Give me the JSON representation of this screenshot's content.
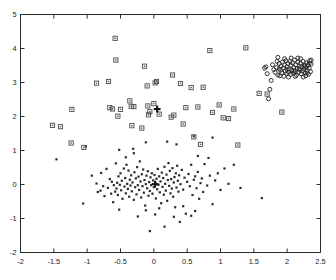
{
  "figure": {
    "title": "",
    "background": "#ffffff",
    "axis_color": "#2b2b2b"
  },
  "axes": {
    "x_ticks": [
      "-2",
      "-1.5",
      "-1",
      "-0.5",
      "0",
      "0.5",
      "1",
      "1.5",
      "2",
      "2.5"
    ],
    "x_tick_values": [
      -2,
      -1.5,
      -1,
      -0.5,
      0,
      0.5,
      1,
      1.5,
      2,
      2.5
    ],
    "y_ticks": [
      "-2",
      "-1",
      "0",
      "1",
      "2",
      "3",
      "4",
      "5"
    ],
    "y_tick_values": [
      -2,
      -1,
      0,
      1,
      2,
      3,
      4,
      5
    ]
  },
  "chart_data": {
    "type": "scatter",
    "title": "",
    "xlabel": "",
    "ylabel": "",
    "xlim": [
      -2,
      2.5
    ],
    "ylim": [
      -2,
      5
    ],
    "grid": false,
    "legend": "none",
    "series": [
      {
        "name": "cluster-1-dots",
        "marker": "filled-dot",
        "color": "#2a2a2a",
        "points": [
          [
            -1.46,
            0.74
          ],
          [
            -1.06,
            -0.56
          ],
          [
            -1.02,
            1.12
          ],
          [
            -0.93,
            0.26
          ],
          [
            -0.86,
            0.03
          ],
          [
            -0.84,
            -0.22
          ],
          [
            -0.8,
            -0.18
          ],
          [
            -0.79,
            0.34
          ],
          [
            -0.76,
            -0.05
          ],
          [
            -0.74,
            -0.34
          ],
          [
            -0.71,
            0.46
          ],
          [
            -0.69,
            -0.1
          ],
          [
            -0.66,
            0.16
          ],
          [
            -0.64,
            -0.27
          ],
          [
            -0.63,
            0.08
          ],
          [
            -0.61,
            -0.52
          ],
          [
            -0.6,
            -0.02
          ],
          [
            -0.58,
            -0.21
          ],
          [
            -0.57,
            0.62
          ],
          [
            -0.56,
            -0.12
          ],
          [
            -0.55,
            0.05
          ],
          [
            -0.54,
            -0.31
          ],
          [
            -0.53,
            0.24
          ],
          [
            -0.52,
            -0.74
          ],
          [
            -0.51,
            -0.01
          ],
          [
            -0.5,
            0.33
          ],
          [
            -0.49,
            -0.17
          ],
          [
            -0.48,
            0.11
          ],
          [
            -0.47,
            -0.42
          ],
          [
            -0.45,
            0.47
          ],
          [
            -0.44,
            -0.06
          ],
          [
            -0.43,
            0.19
          ],
          [
            -0.42,
            -0.26
          ],
          [
            -0.41,
            0.58
          ],
          [
            -0.4,
            0.02
          ],
          [
            -0.39,
            -0.13
          ],
          [
            -0.38,
            0.41
          ],
          [
            -0.37,
            -0.36
          ],
          [
            -0.36,
            0.14
          ],
          [
            -0.35,
            -0.03
          ],
          [
            -0.34,
            0.27
          ],
          [
            -0.33,
            -0.2
          ],
          [
            -0.32,
            0.06
          ],
          [
            -0.31,
            1.05
          ],
          [
            -0.3,
            -0.45
          ],
          [
            -0.29,
            0.36
          ],
          [
            -0.28,
            -0.08
          ],
          [
            -0.27,
            0.18
          ],
          [
            -0.26,
            -0.29
          ],
          [
            -0.25,
            0.51
          ],
          [
            -0.24,
            -0.02
          ],
          [
            -0.23,
            0.23
          ],
          [
            -0.22,
            -0.16
          ],
          [
            -0.21,
            0.68
          ],
          [
            -0.2,
            0.09
          ],
          [
            -0.19,
            -0.38
          ],
          [
            -0.18,
            0.3
          ],
          [
            -0.17,
            -0.05
          ],
          [
            -0.16,
            0.44
          ],
          [
            -0.15,
            -0.24
          ],
          [
            -0.14,
            0.13
          ],
          [
            -0.13,
            -0.62
          ],
          [
            -0.12,
            0.01
          ],
          [
            -0.11,
            0.26
          ],
          [
            -0.1,
            -0.11
          ],
          [
            -0.09,
            0.39
          ],
          [
            -0.08,
            -0.33
          ],
          [
            -0.07,
            0.07
          ],
          [
            -0.06,
            -0.19
          ],
          [
            -0.05,
            0.21
          ],
          [
            -0.04,
            -0.02
          ],
          [
            -0.03,
            0.33
          ],
          [
            -0.02,
            -0.27
          ],
          [
            -0.01,
            0.12
          ],
          [
            0.0,
            -0.08
          ],
          [
            0.01,
            0.28
          ],
          [
            0.02,
            0.04
          ],
          [
            0.03,
            -0.41
          ],
          [
            0.04,
            0.17
          ],
          [
            0.05,
            -0.14
          ],
          [
            0.06,
            0.46
          ],
          [
            0.07,
            -0.01
          ],
          [
            0.08,
            0.24
          ],
          [
            0.09,
            -0.23
          ],
          [
            0.1,
            0.09
          ],
          [
            0.11,
            -0.55
          ],
          [
            0.12,
            0.35
          ],
          [
            0.13,
            -0.07
          ],
          [
            0.14,
            0.19
          ],
          [
            0.15,
            -0.3
          ],
          [
            0.16,
            0.52
          ],
          [
            0.17,
            0.02
          ],
          [
            0.18,
            -0.18
          ],
          [
            0.19,
            0.29
          ],
          [
            0.2,
            -0.48
          ],
          [
            0.21,
            0.13
          ],
          [
            0.22,
            0.63
          ],
          [
            0.23,
            -0.04
          ],
          [
            0.24,
            0.4
          ],
          [
            0.25,
            -0.26
          ],
          [
            0.26,
            0.16
          ],
          [
            0.27,
            -0.12
          ],
          [
            0.28,
            0.48
          ],
          [
            0.29,
            -0.36
          ],
          [
            0.3,
            0.06
          ],
          [
            0.31,
            0.22
          ],
          [
            0.32,
            -0.67
          ],
          [
            0.33,
            0.33
          ],
          [
            0.34,
            -0.09
          ],
          [
            0.35,
            0.55
          ],
          [
            0.36,
            0.11
          ],
          [
            0.37,
            -0.21
          ],
          [
            0.38,
            0.27
          ],
          [
            0.39,
            -1.1
          ],
          [
            0.4,
            0.01
          ],
          [
            0.42,
            0.43
          ],
          [
            0.44,
            -0.15
          ],
          [
            0.46,
            0.2
          ],
          [
            0.48,
            -0.86
          ],
          [
            0.5,
            0.08
          ],
          [
            0.52,
            0.31
          ],
          [
            0.54,
            -0.05
          ],
          [
            0.56,
            0.58
          ],
          [
            0.58,
            -0.31
          ],
          [
            0.6,
            0.14
          ],
          [
            0.62,
            0.24
          ],
          [
            0.64,
            -0.11
          ],
          [
            0.66,
            0.37
          ],
          [
            0.68,
            -0.42
          ],
          [
            0.7,
            0.04
          ],
          [
            0.72,
            0.18
          ],
          [
            0.74,
            -0.22
          ],
          [
            0.76,
            0.6
          ],
          [
            0.8,
            -0.03
          ],
          [
            0.84,
            0.26
          ],
          [
            0.88,
            -0.58
          ],
          [
            0.92,
            0.12
          ],
          [
            0.96,
            0.33
          ],
          [
            1.0,
            -0.16
          ],
          [
            1.06,
            0.47
          ],
          [
            1.12,
            0.02
          ],
          [
            1.2,
            0.58
          ],
          [
            1.3,
            -0.1
          ],
          [
            1.62,
            -0.4
          ],
          [
            -0.24,
            -0.94
          ],
          [
            -0.12,
            -0.76
          ],
          [
            -0.06,
            -1.37
          ],
          [
            0.02,
            -0.88
          ],
          [
            0.08,
            -0.7
          ],
          [
            0.16,
            -1.24
          ],
          [
            0.3,
            -0.95
          ],
          [
            0.44,
            -0.64
          ],
          [
            0.56,
            -0.92
          ],
          [
            0.62,
            -0.78
          ],
          [
            0.2,
            1.26
          ],
          [
            0.34,
            1.18
          ],
          [
            -0.12,
            1.24
          ],
          [
            0.6,
            1.42
          ],
          [
            0.88,
            1.38
          ],
          [
            0.66,
            0.84
          ],
          [
            0.82,
            0.78
          ],
          [
            -0.42,
            0.8
          ],
          [
            -0.52,
            1.02
          ],
          [
            -0.3,
            0.92
          ]
        ]
      },
      {
        "name": "cluster-2-squares",
        "marker": "open-square",
        "color": "#4a4a4a",
        "points": [
          [
            -1.52,
            1.74
          ],
          [
            -1.4,
            1.7
          ],
          [
            -1.24,
            1.22
          ],
          [
            -1.23,
            2.21
          ],
          [
            -1.05,
            1.09
          ],
          [
            -0.86,
            2.98
          ],
          [
            -0.68,
            3.03
          ],
          [
            -0.66,
            2.26
          ],
          [
            -0.62,
            2.22
          ],
          [
            -0.58,
            4.3
          ],
          [
            -0.57,
            3.66
          ],
          [
            -0.54,
            2.01
          ],
          [
            -0.5,
            2.21
          ],
          [
            -0.36,
            2.46
          ],
          [
            -0.34,
            2.3
          ],
          [
            -0.33,
            1.73
          ],
          [
            -0.3,
            2.29
          ],
          [
            -0.18,
            1.66
          ],
          [
            -0.14,
            3.48
          ],
          [
            -0.1,
            2.9
          ],
          [
            -0.09,
            2.31
          ],
          [
            -0.08,
            2.05
          ],
          [
            -0.06,
            2.14
          ],
          [
            0.0,
            2.38
          ],
          [
            0.04,
            3.03
          ],
          [
            0.02,
            2.99
          ],
          [
            0.08,
            2.07
          ],
          [
            0.26,
            1.98
          ],
          [
            0.28,
            3.22
          ],
          [
            0.3,
            2.04
          ],
          [
            0.4,
            2.97
          ],
          [
            0.44,
            1.78
          ],
          [
            0.48,
            2.26
          ],
          [
            0.56,
            2.85
          ],
          [
            0.6,
            1.4
          ],
          [
            0.66,
            2.28
          ],
          [
            0.7,
            1.18
          ],
          [
            0.74,
            2.86
          ],
          [
            0.84,
            3.94
          ],
          [
            0.88,
            2.12
          ],
          [
            0.98,
            2.34
          ],
          [
            1.04,
            1.96
          ],
          [
            1.12,
            1.94
          ],
          [
            1.2,
            2.22
          ],
          [
            1.26,
            1.16
          ],
          [
            1.38,
            4.02
          ],
          [
            1.58,
            2.68
          ],
          [
            1.7,
            2.66
          ],
          [
            1.92,
            2.13
          ]
        ]
      },
      {
        "name": "cluster-3-circles",
        "marker": "open-circle",
        "color": "#2a2a2a",
        "points": [
          [
            1.72,
            2.52
          ],
          [
            1.74,
            2.8
          ],
          [
            1.76,
            3.06
          ],
          [
            1.7,
            3.26
          ],
          [
            1.8,
            3.38
          ],
          [
            1.84,
            3.44
          ],
          [
            1.86,
            3.22
          ],
          [
            1.88,
            3.56
          ],
          [
            1.9,
            3.36
          ],
          [
            1.91,
            3.48
          ],
          [
            1.92,
            3.28
          ],
          [
            1.93,
            3.6
          ],
          [
            1.94,
            3.42
          ],
          [
            1.95,
            3.18
          ],
          [
            1.96,
            3.52
          ],
          [
            1.97,
            3.34
          ],
          [
            1.98,
            3.64
          ],
          [
            1.99,
            3.26
          ],
          [
            2.0,
            3.46
          ],
          [
            2.01,
            3.56
          ],
          [
            2.02,
            3.3
          ],
          [
            2.03,
            3.4
          ],
          [
            2.04,
            3.62
          ],
          [
            2.05,
            3.24
          ],
          [
            2.06,
            3.5
          ],
          [
            2.07,
            3.36
          ],
          [
            2.08,
            3.58
          ],
          [
            2.09,
            3.28
          ],
          [
            2.1,
            3.44
          ],
          [
            2.11,
            3.66
          ],
          [
            2.12,
            3.32
          ],
          [
            2.13,
            3.52
          ],
          [
            2.14,
            3.22
          ],
          [
            2.15,
            3.42
          ],
          [
            2.16,
            3.6
          ],
          [
            2.17,
            3.3
          ],
          [
            2.18,
            3.48
          ],
          [
            2.19,
            3.38
          ],
          [
            2.2,
            3.56
          ],
          [
            2.21,
            3.26
          ],
          [
            2.22,
            3.46
          ],
          [
            2.23,
            3.34
          ],
          [
            2.24,
            3.62
          ],
          [
            2.25,
            3.4
          ],
          [
            2.26,
            3.52
          ],
          [
            2.27,
            3.28
          ],
          [
            2.28,
            3.44
          ],
          [
            2.29,
            3.58
          ],
          [
            2.3,
            3.36
          ],
          [
            2.31,
            3.5
          ],
          [
            2.32,
            3.24
          ],
          [
            2.33,
            3.42
          ],
          [
            2.34,
            3.64
          ],
          [
            2.35,
            3.32
          ],
          [
            2.36,
            3.54
          ],
          [
            1.78,
            3.52
          ],
          [
            1.82,
            3.3
          ],
          [
            1.85,
            3.62
          ],
          [
            1.89,
            3.2
          ],
          [
            2.06,
            3.72
          ],
          [
            2.12,
            3.18
          ],
          [
            2.2,
            3.7
          ],
          [
            2.28,
            3.2
          ],
          [
            2.33,
            3.56
          ],
          [
            1.96,
            3.7
          ],
          [
            2.02,
            3.16
          ],
          [
            2.16,
            3.72
          ],
          [
            2.24,
            3.16
          ],
          [
            1.88,
            3.4
          ],
          [
            2.0,
            3.38
          ],
          [
            2.1,
            3.34
          ],
          [
            2.18,
            3.4
          ],
          [
            2.26,
            3.48
          ],
          [
            2.3,
            3.28
          ],
          [
            1.86,
            3.74
          ],
          [
            2.36,
            3.66
          ],
          [
            1.66,
            3.42
          ],
          [
            1.68,
            3.46
          ]
        ]
      }
    ],
    "centroids": {
      "marker": "bold-plus",
      "color": "#111111",
      "points": [
        [
          0.05,
          2.22
        ],
        [
          0.02,
          0.01
        ]
      ]
    }
  }
}
